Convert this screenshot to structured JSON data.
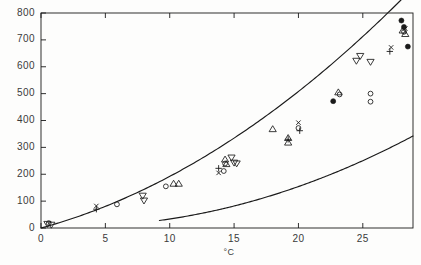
{
  "chart_data": {
    "type": "scatter",
    "title": "",
    "subtitle": "",
    "xlabel": "°C",
    "ylabel": "",
    "xlim": [
      0,
      28.9
    ],
    "ylim": [
      0,
      800
    ],
    "grid": false,
    "legend_position": "none",
    "xticks": [
      0,
      5,
      10,
      15,
      20,
      25
    ],
    "xtick_labels": [
      "0",
      "5",
      "10",
      "15",
      "20",
      "25"
    ],
    "yticks": [
      0,
      100,
      200,
      300,
      400,
      500,
      600,
      700,
      800
    ],
    "ytick_labels": [
      "0",
      "100",
      "200",
      "300",
      "400",
      "500",
      "600",
      "700",
      "800"
    ],
    "series": [
      {
        "name": "open-circle",
        "marker": "circle-open",
        "points": [
          [
            0.6,
            18
          ],
          [
            5.9,
            88
          ],
          [
            9.7,
            155
          ],
          [
            14.2,
            212
          ],
          [
            14.3,
            240
          ],
          [
            20.0,
            372
          ],
          [
            23.2,
            497
          ],
          [
            25.6,
            500
          ],
          [
            25.6,
            470
          ],
          [
            28.2,
            730
          ]
        ]
      },
      {
        "name": "up-triangle",
        "marker": "triangle-up",
        "points": [
          [
            10.3,
            165
          ],
          [
            10.7,
            165
          ],
          [
            14.3,
            255
          ],
          [
            14.4,
            238
          ],
          [
            18.0,
            368
          ],
          [
            19.2,
            335
          ],
          [
            19.2,
            318
          ],
          [
            23.1,
            505
          ],
          [
            28.1,
            735
          ],
          [
            28.3,
            722
          ]
        ]
      },
      {
        "name": "down-triangle",
        "marker": "triangle-down",
        "points": [
          [
            0.5,
            15
          ],
          [
            0.8,
            12
          ],
          [
            7.9,
            120
          ],
          [
            8.0,
            102
          ],
          [
            14.8,
            262
          ],
          [
            15.0,
            243
          ],
          [
            15.2,
            240
          ],
          [
            24.5,
            622
          ],
          [
            24.8,
            640
          ],
          [
            25.6,
            618
          ]
        ]
      },
      {
        "name": "plus",
        "marker": "plus",
        "points": [
          [
            4.3,
            70
          ],
          [
            13.8,
            222
          ],
          [
            19.2,
            330
          ],
          [
            20.1,
            362
          ],
          [
            27.1,
            657
          ]
        ]
      },
      {
        "name": "cross",
        "marker": "cross",
        "points": [
          [
            4.3,
            82
          ],
          [
            13.8,
            205
          ],
          [
            20.0,
            392
          ],
          [
            27.2,
            672
          ],
          [
            28.3,
            742
          ]
        ]
      },
      {
        "name": "filled-circle",
        "marker": "circle-filled",
        "points": [
          [
            22.7,
            472
          ],
          [
            28.0,
            772
          ],
          [
            28.2,
            748
          ],
          [
            28.5,
            675
          ]
        ]
      }
    ],
    "curves": [
      {
        "name": "upper-fitted-curve",
        "x_start": 0.0,
        "x_end": 28.4,
        "description": "smooth rising curve through the data points"
      },
      {
        "name": "lower-curve",
        "x_start": 9.2,
        "x_end": 28.9,
        "description": "second smooth curve offset below the data"
      }
    ]
  },
  "axes": {
    "x_title": "°C"
  }
}
